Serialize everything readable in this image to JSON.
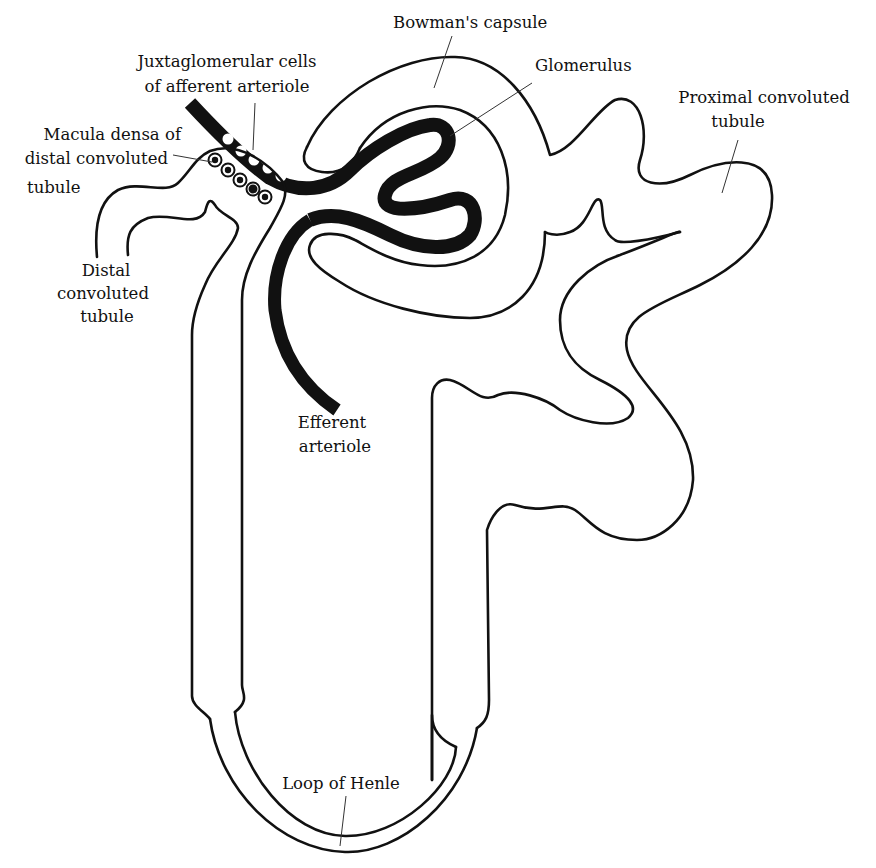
{
  "diagram": {
    "colors": {
      "line": "#111111",
      "background": "#ffffff",
      "leader": "#333333"
    },
    "labels": {
      "bowmans_capsule": "Bowman's capsule",
      "glomerulus": "Glomerulus",
      "juxtaglomerular_line1": "Juxtaglomerular cells",
      "juxtaglomerular_line2": "of afferent arteriole",
      "macula_densa_line1": "Macula densa of",
      "macula_densa_line2": "distal convoluted",
      "macula_densa_line3": "tubule",
      "proximal_line1": "Proximal convoluted",
      "proximal_line2": "tubule",
      "distal_line1": "Distal",
      "distal_line2": "convoluted",
      "distal_line3": "tubule",
      "efferent_line1": "Efferent",
      "efferent_line2": "arteriole",
      "loop_of_henle": "Loop of Henle"
    }
  }
}
